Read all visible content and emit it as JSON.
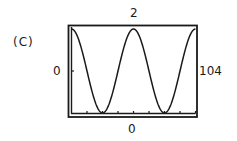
{
  "panel": {
    "label": "(C)"
  },
  "window_labels": {
    "ymax": "2",
    "ymin": "0",
    "xmin": "0",
    "xmax": "104"
  },
  "colors": {
    "line": "#1a1a1a",
    "background": "#ffffff"
  },
  "chart_data": {
    "type": "line",
    "title": "(C)",
    "xlabel": "",
    "ylabel": "",
    "xlim": [
      0,
      104
    ],
    "ylim": [
      0,
      2
    ],
    "x_ticks": [
      0,
      13,
      26,
      39,
      52,
      65,
      78,
      91,
      104
    ],
    "y_ticks": [
      0,
      1,
      2
    ],
    "grid": false,
    "legend": null,
    "function": "y = 1 + cos(2*pi*x/52)",
    "series": [
      {
        "name": "curve",
        "x": [
          0,
          6.5,
          13,
          19.5,
          26,
          32.5,
          39,
          45.5,
          52,
          58.5,
          65,
          71.5,
          78,
          84.5,
          91,
          97.5,
          104
        ],
        "values": [
          2,
          1.71,
          1,
          0.29,
          0,
          0.29,
          1,
          1.71,
          2,
          1.71,
          1,
          0.29,
          0,
          0.29,
          1,
          1.71,
          2
        ]
      }
    ],
    "annotations": {
      "top": "2",
      "left": "0",
      "right": "104",
      "bottom": "0"
    }
  }
}
